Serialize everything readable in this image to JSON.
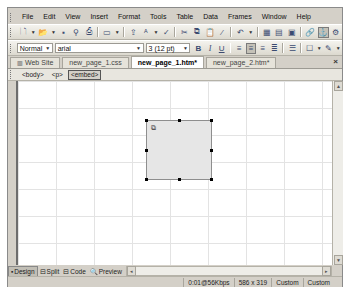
{
  "menubar": {
    "items": [
      {
        "label": "File"
      },
      {
        "label": "Edit"
      },
      {
        "label": "View"
      },
      {
        "label": "Insert"
      },
      {
        "label": "Format"
      },
      {
        "label": "Tools"
      },
      {
        "label": "Table"
      },
      {
        "label": "Data"
      },
      {
        "label": "Frames"
      },
      {
        "label": "Window"
      },
      {
        "label": "Help"
      }
    ]
  },
  "standard_toolbar": {
    "icons": [
      "new-page-icon",
      "open-icon",
      "save-icon",
      "search-icon",
      "print-icon",
      "preview-icon",
      "cut-icon",
      "copy-icon",
      "paste-icon",
      "format-painter-icon",
      "undo-icon",
      "insert-table-icon",
      "insert-layer-icon",
      "insert-frame-icon",
      "hyperlink-icon",
      "anchor-icon",
      "web-component-icon"
    ]
  },
  "formatting_toolbar": {
    "style": "Normal",
    "font": "arial",
    "size": "3 (12 pt)",
    "bold": "B",
    "italic": "I",
    "underline": "U"
  },
  "tabs": {
    "items": [
      {
        "label": "Web Site",
        "active": false
      },
      {
        "label": "new_page_1.css",
        "active": false
      },
      {
        "label": "new_page_1.htm*",
        "active": true
      },
      {
        "label": "new_page_2.htm*",
        "active": false
      }
    ],
    "close": "×"
  },
  "tagbar": {
    "tags": [
      "<body>",
      "<p>",
      "<embed>"
    ],
    "selected": "<embed>"
  },
  "canvas": {
    "embed_object": {
      "plugin_icon": "plugin-placeholder-icon"
    }
  },
  "viewbar": {
    "buttons": [
      {
        "label": "Design",
        "active": true
      },
      {
        "label": "Split",
        "active": false
      },
      {
        "label": "Code",
        "active": false
      },
      {
        "label": "Preview",
        "active": false
      }
    ]
  },
  "statusbar": {
    "download_time": "0:01@56Kbps",
    "dimensions": "586 x 319",
    "mode1": "Custom",
    "mode2": "Custom"
  }
}
